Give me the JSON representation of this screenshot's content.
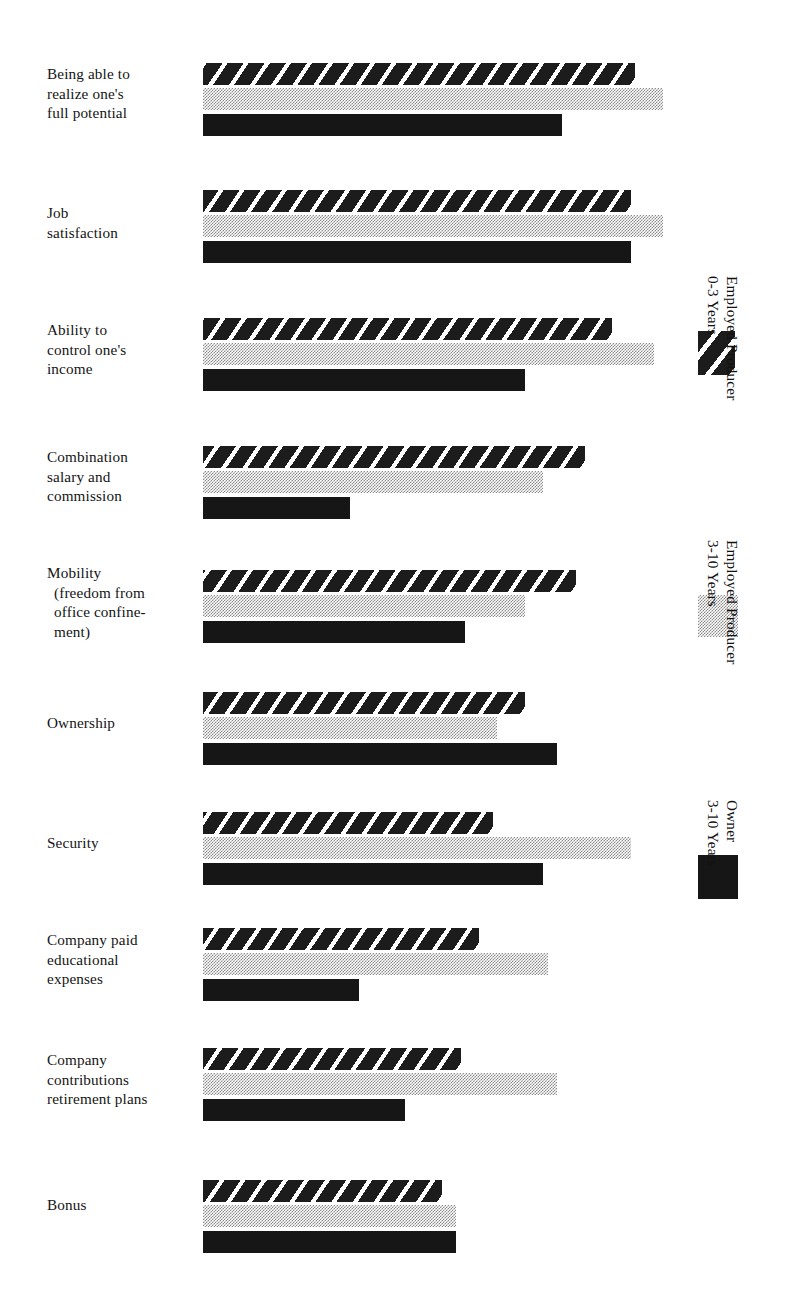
{
  "chart_data": {
    "type": "bar",
    "orientation": "horizontal",
    "title": "",
    "subtitle": "",
    "xlabel": "",
    "ylabel": "",
    "grid": false,
    "axis_ticks_visible": false,
    "legend_position": "right-rotated",
    "xlim": [
      0,
      100
    ],
    "categories": [
      "Being able to\nrealize one's\nfull potential",
      "Job\nsatisfaction",
      "Ability to\ncontrol one's\nincome",
      "Combination\nsalary and\ncommission",
      "Mobility\n(freedom from\noffice confine-\nment)",
      "Ownership",
      "Security",
      "Company paid\neducational\nexpenses",
      "Company\ncontributions\nretirement plans",
      "Bonus"
    ],
    "series": [
      {
        "name": "Employed Producer 0-3 Years",
        "pattern": "diagonal-hatch",
        "color": "#1c1c1c",
        "values": [
          94,
          93,
          89,
          83,
          81,
          70,
          63,
          60,
          56,
          52
        ]
      },
      {
        "name": "Employed Producer 3-10 Years",
        "pattern": "dithered-gray",
        "color": "#8a8a8a",
        "values": [
          100,
          100,
          98,
          74,
          70,
          64,
          93,
          75,
          77,
          55
        ]
      },
      {
        "name": "Owner 3-10 Years",
        "pattern": "solid-black",
        "color": "#161616",
        "values": [
          78,
          93,
          70,
          32,
          57,
          77,
          74,
          34,
          44,
          55
        ]
      }
    ]
  },
  "legend": {
    "entries": [
      {
        "label": "Employed Producer\n0-3 Years",
        "swatch": "hatch-swatch"
      },
      {
        "label": "Employed Producer\n3-10 Years",
        "swatch": "gray-swatch"
      },
      {
        "label": "Owner\n3-10 Years",
        "swatch": "black-swatch"
      }
    ]
  },
  "colors": {
    "background": "#ffffff",
    "ink": "#161616",
    "gray_tone": "#8a8a8a"
  }
}
